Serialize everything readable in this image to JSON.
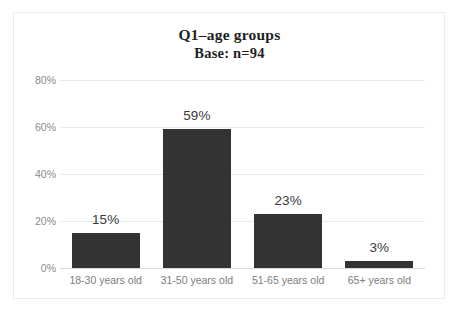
{
  "chart_data": {
    "type": "bar",
    "title": "Q1–age groups",
    "subtitle": "Base: n=94",
    "categories": [
      "18-30 years old",
      "31-50 years old",
      "51-65 years old",
      "65+ years old"
    ],
    "values": [
      15,
      59,
      23,
      3
    ],
    "value_labels": [
      "15%",
      "59%",
      "23%",
      "3%"
    ],
    "xlabel": "",
    "ylabel": "",
    "ylim": [
      0,
      80
    ],
    "y_ticks": [
      0,
      20,
      40,
      60,
      80
    ],
    "y_tick_labels": [
      "0%",
      "20%",
      "40%",
      "60%",
      "80%"
    ],
    "grid": true,
    "legend": false,
    "bar_color": "#333333",
    "gridline_color": "#e9e9e9",
    "tick_label_color": "#8a8a8a",
    "frame_color": "#ececec",
    "background_color": "#ffffff"
  }
}
